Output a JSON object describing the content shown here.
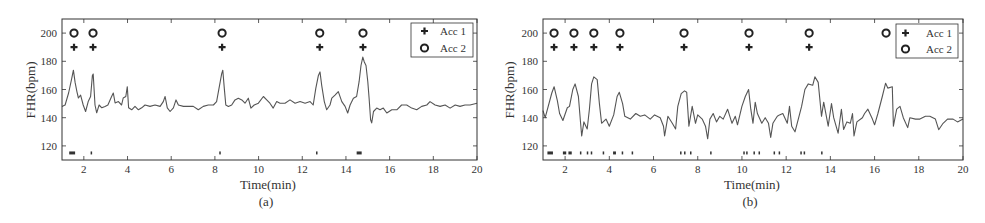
{
  "figure": {
    "panels": [
      "(a)",
      "(b)"
    ]
  },
  "chart_data": [
    {
      "type": "line",
      "panel_label": "(a)",
      "title": "",
      "xlabel": "Time(min)",
      "ylabel": "FHR(bpm)",
      "xlim": [
        1,
        20
      ],
      "ylim": [
        110,
        210
      ],
      "xticks": [
        2,
        4,
        6,
        8,
        10,
        12,
        14,
        16,
        18,
        20
      ],
      "yticks": [
        120,
        140,
        160,
        180,
        200
      ],
      "grid": false,
      "legend": {
        "position": "upper right",
        "entries": [
          {
            "label": "Acc 1",
            "marker": "plus"
          },
          {
            "label": "Acc 2",
            "marker": "circle"
          }
        ]
      },
      "series": [
        {
          "name": "FHR",
          "color": "#555555",
          "x": [
            1.0,
            1.14,
            1.3,
            1.45,
            1.52,
            1.6,
            1.68,
            1.75,
            1.85,
            1.97,
            2.08,
            2.2,
            2.31,
            2.39,
            2.43,
            2.51,
            2.59,
            2.7,
            2.82,
            2.97,
            3.1,
            3.27,
            3.35,
            3.43,
            3.58,
            3.73,
            3.8,
            3.92,
            3.99,
            4.05,
            4.19,
            4.34,
            4.5,
            4.65,
            4.8,
            5.03,
            5.26,
            5.49,
            5.64,
            5.72,
            5.82,
            5.95,
            6.1,
            6.22,
            6.33,
            6.56,
            6.78,
            7.01,
            7.24,
            7.47,
            7.7,
            7.93,
            8.08,
            8.19,
            8.31,
            8.36,
            8.43,
            8.5,
            8.62,
            8.77,
            8.92,
            9.07,
            9.23,
            9.38,
            9.53,
            9.65,
            9.8,
            9.99,
            10.22,
            10.37,
            10.52,
            10.67,
            10.83,
            10.98,
            11.21,
            11.44,
            11.67,
            11.9,
            12.13,
            12.36,
            12.5,
            12.62,
            12.74,
            12.81,
            12.89,
            13.01,
            13.12,
            13.27,
            13.35,
            13.5,
            13.65,
            13.81,
            13.96,
            14.08,
            14.19,
            14.34,
            14.49,
            14.6,
            14.69,
            14.77,
            14.84,
            14.92,
            15.0,
            15.06,
            15.13,
            15.18,
            15.26,
            15.41,
            15.56,
            15.71,
            15.87,
            16.1,
            16.33,
            16.55,
            16.78,
            17.01,
            17.24,
            17.47,
            17.7,
            17.85,
            18.08,
            18.31,
            18.54,
            18.77,
            19.0,
            19.22,
            19.45,
            19.68,
            20.0
          ],
          "values": [
            148,
            149,
            157.5,
            168,
            173.7,
            165,
            158.5,
            154,
            156,
            149,
            144.4,
            151.4,
            155,
            170,
            171,
            149,
            143.5,
            149,
            147,
            148,
            149,
            155,
            157.5,
            150.5,
            151.4,
            149,
            154,
            155,
            162,
            147,
            145.6,
            148,
            145.6,
            147,
            149,
            148,
            149,
            148,
            151.4,
            155,
            147,
            144.4,
            147,
            152.6,
            149,
            148,
            148,
            148,
            145.6,
            148,
            149,
            149,
            151.4,
            160.8,
            171.3,
            173.7,
            160.8,
            149,
            148,
            149,
            152.6,
            153.8,
            152.6,
            150.3,
            153.8,
            146.8,
            149,
            150.3,
            155,
            152.6,
            150.3,
            146.8,
            151.4,
            150.3,
            150.3,
            152.6,
            150.3,
            151.4,
            150.3,
            151.4,
            149,
            160.8,
            170,
            172.5,
            163,
            151.4,
            145.6,
            149,
            153.8,
            156,
            158.5,
            151.4,
            148,
            143.3,
            149,
            153.8,
            155,
            165.5,
            177,
            183,
            179.5,
            177,
            165.5,
            153.8,
            138.6,
            136.3,
            144.4,
            146.8,
            145.6,
            146.8,
            143.3,
            145.6,
            145.6,
            149,
            149,
            146.8,
            145.6,
            148,
            149,
            151.4,
            149,
            148,
            149,
            146.8,
            149,
            148,
            149,
            149,
            150.3
          ]
        },
        {
          "name": "Acc 1",
          "marker": "plus",
          "y": 190,
          "x": [
            1.55,
            2.42,
            8.33,
            12.8,
            14.78
          ]
        },
        {
          "name": "Acc 2",
          "marker": "circle",
          "y": 200,
          "x": [
            1.55,
            2.42,
            8.33,
            12.8,
            14.78
          ]
        },
        {
          "name": "Events",
          "marker": "tick",
          "y": 115,
          "segments": [
            [
              1.33,
              1.6
            ],
            [
              2.31,
              2.33
            ],
            [
              8.2,
              8.24
            ],
            [
              12.63,
              12.67
            ],
            [
              14.49,
              14.72
            ]
          ]
        }
      ]
    },
    {
      "type": "line",
      "panel_label": "(b)",
      "title": "",
      "xlabel": "Time(min)",
      "ylabel": "FHR(bpm)",
      "xlim": [
        1,
        20
      ],
      "ylim": [
        110,
        210
      ],
      "xticks": [
        2,
        4,
        6,
        8,
        10,
        12,
        14,
        16,
        18,
        20
      ],
      "yticks": [
        120,
        140,
        160,
        180,
        200
      ],
      "grid": false,
      "legend": {
        "position": "upper right",
        "entries": [
          {
            "label": "Acc 1",
            "marker": "plus"
          },
          {
            "label": "Acc 2",
            "marker": "circle"
          }
        ]
      },
      "series": [
        {
          "name": "FHR",
          "color": "#555555",
          "x": [
            1.0,
            1.1,
            1.4,
            1.5,
            1.65,
            1.75,
            1.9,
            2.1,
            2.2,
            2.35,
            2.45,
            2.6,
            2.7,
            2.75,
            2.85,
            3.0,
            3.1,
            3.2,
            3.3,
            3.45,
            3.55,
            3.65,
            3.85,
            4.0,
            4.2,
            4.35,
            4.45,
            4.6,
            4.7,
            4.95,
            5.2,
            5.4,
            5.6,
            5.85,
            6.05,
            6.3,
            6.45,
            6.5,
            6.65,
            6.85,
            7.0,
            7.1,
            7.25,
            7.4,
            7.5,
            7.6,
            7.75,
            7.9,
            8.0,
            8.2,
            8.35,
            8.45,
            8.55,
            8.7,
            8.85,
            9.0,
            9.15,
            9.35,
            9.55,
            9.7,
            9.8,
            10.0,
            10.15,
            10.3,
            10.4,
            10.5,
            10.6,
            10.7,
            10.9,
            11.05,
            11.2,
            11.3,
            11.4,
            11.6,
            11.7,
            11.85,
            12.05,
            12.15,
            12.25,
            12.4,
            12.55,
            12.7,
            12.85,
            13.0,
            13.2,
            13.3,
            13.45,
            13.6,
            13.7,
            13.9,
            14.05,
            14.15,
            14.35,
            14.5,
            14.6,
            14.75,
            14.9,
            15.0,
            15.07,
            15.2,
            15.45,
            15.55,
            15.7,
            15.9,
            16.0,
            16.15,
            16.35,
            16.5,
            16.6,
            16.8,
            16.85,
            17.0,
            17.15,
            17.3,
            17.5,
            17.6,
            17.85,
            18.05,
            18.3,
            18.5,
            18.75,
            18.9,
            19.1,
            19.3,
            19.55,
            19.75,
            20.0
          ],
          "values": [
            145,
            140,
            157.5,
            162,
            152,
            143,
            138,
            147,
            148,
            160,
            164,
            155,
            136,
            127,
            137,
            132,
            146,
            164,
            169,
            167,
            150,
            136,
            139,
            134,
            142,
            155,
            158,
            150,
            141,
            139,
            143,
            141,
            142,
            139,
            142,
            140,
            134,
            127,
            141,
            136,
            132,
            148,
            157,
            159,
            158,
            134,
            148,
            136,
            142,
            139,
            134,
            125,
            139,
            143,
            137,
            141,
            139,
            146,
            136,
            141,
            135,
            148,
            155,
            160,
            146,
            136,
            151,
            143,
            136,
            140,
            136,
            126,
            136,
            141,
            142,
            143,
            136,
            148,
            134,
            130,
            139,
            148,
            160,
            164,
            163,
            169,
            165,
            141,
            151,
            134,
            150,
            140,
            129,
            146,
            131.6,
            137,
            136,
            143,
            127,
            137,
            140,
            143,
            146,
            139,
            135,
            143,
            155,
            164.5,
            161,
            162,
            134,
            146,
            148,
            140,
            133,
            140,
            139,
            139,
            141,
            141,
            139,
            131.5,
            136,
            139,
            139,
            137,
            139
          ]
        },
        {
          "name": "Acc 1",
          "marker": "plus",
          "y": 190,
          "x": [
            1.5,
            2.4,
            3.3,
            4.48,
            7.38,
            10.32,
            13.04
          ]
        },
        {
          "name": "Acc 2",
          "marker": "circle",
          "y": 200,
          "x": [
            1.5,
            2.4,
            3.3,
            4.48,
            7.38,
            10.32,
            13.04,
            16.52
          ]
        },
        {
          "name": "Events",
          "marker": "tick",
          "y": 115,
          "segments": [
            [
              1.2,
              1.45
            ],
            [
              1.9,
              2.05
            ],
            [
              2.15,
              2.3
            ],
            [
              2.67,
              2.69
            ],
            [
              2.98,
              3.0
            ],
            [
              3.16,
              3.18
            ],
            [
              3.7,
              3.72
            ],
            [
              4.17,
              4.3
            ],
            [
              4.56,
              4.58
            ],
            [
              5.01,
              5.03
            ],
            [
              7.2,
              7.22
            ],
            [
              7.38,
              7.4
            ],
            [
              7.65,
              7.67
            ],
            [
              8.56,
              8.6
            ],
            [
              10.06,
              10.08
            ],
            [
              10.19,
              10.21
            ],
            [
              10.52,
              10.54
            ],
            [
              10.75,
              10.77
            ],
            [
              11.43,
              11.45
            ],
            [
              11.66,
              11.68
            ],
            [
              12.64,
              12.66
            ],
            [
              12.79,
              12.81
            ],
            [
              13.58,
              13.6
            ]
          ]
        }
      ]
    }
  ]
}
